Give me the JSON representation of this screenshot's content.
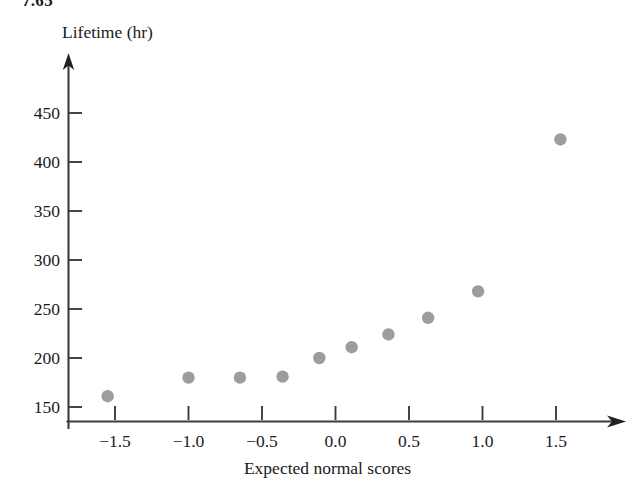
{
  "page": {
    "stray_header_text": "7.65",
    "background_color": "#ffffff"
  },
  "chart_data": {
    "type": "scatter",
    "title": "",
    "subtitle": "",
    "xlabel": "Expected normal scores",
    "ylabel": "Lifetime (hr)",
    "xlim": [
      -1.82,
      1.78
    ],
    "ylim": [
      140,
      470
    ],
    "xticks": [
      -1.5,
      -1.0,
      -0.5,
      0.0,
      0.5,
      1.0,
      1.5
    ],
    "xticklabels": [
      "−1.5",
      "−1.0",
      "−0.5",
      "0.0",
      "0.5",
      "1.0",
      "1.5"
    ],
    "yticks": [
      150,
      200,
      250,
      300,
      350,
      400,
      450
    ],
    "yticklabels": [
      "150",
      "200",
      "250",
      "300",
      "350",
      "400",
      "450"
    ],
    "grid": false,
    "legend": null,
    "marker": {
      "shape": "circle",
      "color": "#9d9d9d",
      "radius_px": 6.2
    },
    "axis_style": {
      "color": "#3b3b3b",
      "arrow_tipped": true,
      "spines": [
        "left",
        "bottom"
      ]
    },
    "x": [
      -1.55,
      -1.0,
      -0.65,
      -0.36,
      -0.11,
      0.11,
      0.36,
      0.63,
      0.97,
      1.53
    ],
    "y": [
      161,
      180,
      180,
      181,
      200,
      211,
      224,
      241,
      268,
      423
    ],
    "points": [
      {
        "x": -1.55,
        "y": 161
      },
      {
        "x": -1.0,
        "y": 180
      },
      {
        "x": -0.65,
        "y": 180
      },
      {
        "x": -0.36,
        "y": 181
      },
      {
        "x": -0.11,
        "y": 200
      },
      {
        "x": 0.11,
        "y": 211
      },
      {
        "x": 0.36,
        "y": 224
      },
      {
        "x": 0.63,
        "y": 241
      },
      {
        "x": 0.97,
        "y": 268
      },
      {
        "x": 1.53,
        "y": 423
      }
    ],
    "series": [
      {
        "name": "Lifetime normal probability plot",
        "values": [
          161,
          180,
          180,
          181,
          200,
          211,
          224,
          241,
          268,
          423
        ]
      }
    ]
  }
}
